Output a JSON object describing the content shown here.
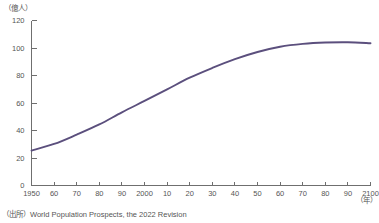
{
  "labels": {
    "y_unit": "（億人）",
    "x_unit": "（年）",
    "source": "（出所）World Population Prospects, the 2022 Revision"
  },
  "style": {
    "series_color": "#5b4f7d",
    "axis_color": "#6f6f6f",
    "text_color": "#555555",
    "background": "#ffffff"
  },
  "chart_data": {
    "type": "line",
    "title": "",
    "subtitle": "",
    "xlabel": "（年）",
    "ylabel": "（億人）",
    "xlim": [
      1950,
      2100
    ],
    "ylim": [
      0,
      120
    ],
    "grid": false,
    "legend": "none",
    "ytick_labels": [
      "0",
      "20",
      "40",
      "60",
      "80",
      "100",
      "120"
    ],
    "ytick_values": [
      0,
      20,
      40,
      60,
      80,
      100,
      120
    ],
    "xtick_labels": [
      "1950",
      "60",
      "70",
      "80",
      "90",
      "2000",
      "10",
      "20",
      "30",
      "40",
      "50",
      "60",
      "70",
      "80",
      "90",
      "2100"
    ],
    "xtick_values": [
      1950,
      1960,
      1970,
      1980,
      1990,
      2000,
      2010,
      2020,
      2030,
      2040,
      2050,
      2060,
      2070,
      2080,
      2090,
      2100
    ],
    "series": [
      {
        "name": "世界人口",
        "x": [
          1950,
          1960,
          1970,
          1980,
          1990,
          2000,
          2010,
          2020,
          2030,
          2040,
          2050,
          2060,
          2070,
          2080,
          2090,
          2100
        ],
        "values": [
          25.4,
          30.2,
          37.0,
          44.4,
          53.2,
          61.5,
          69.9,
          78.4,
          85.5,
          91.9,
          97.1,
          100.9,
          103.0,
          104.0,
          104.2,
          103.5
        ]
      }
    ]
  }
}
